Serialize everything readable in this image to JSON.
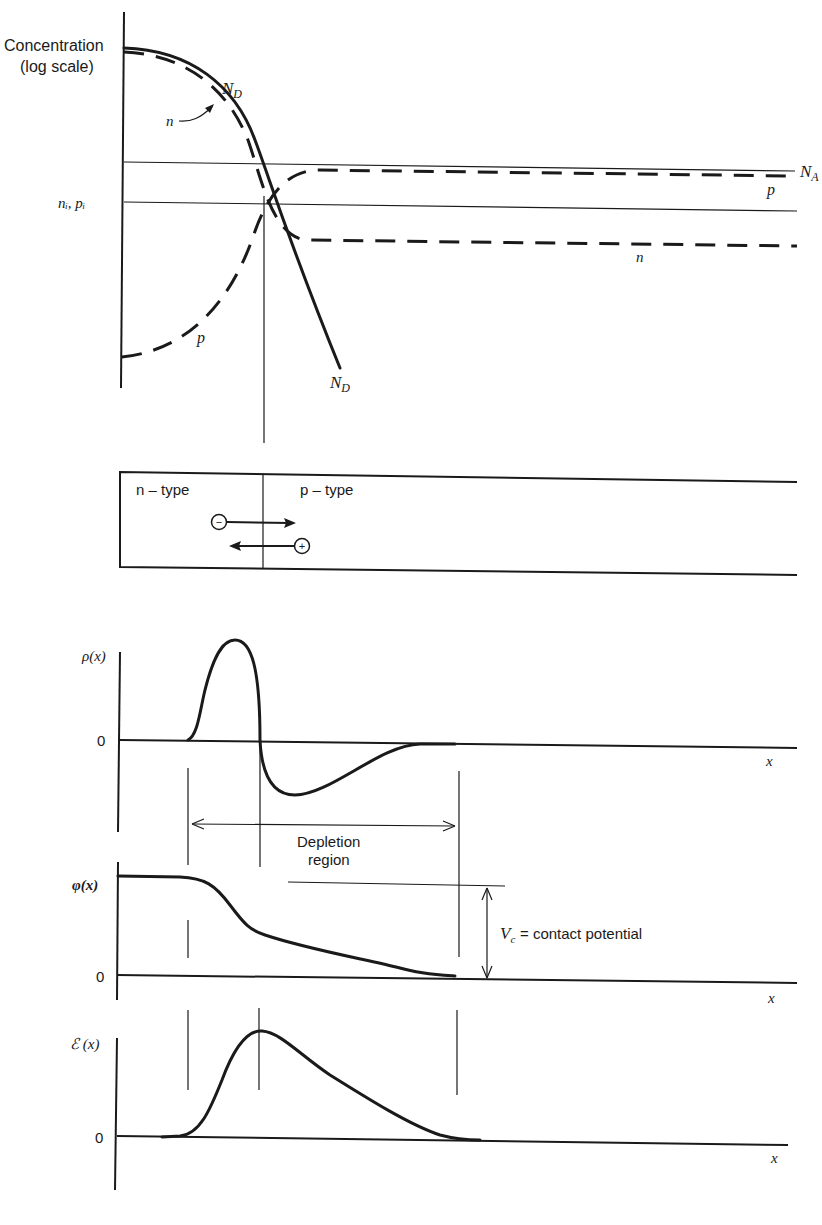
{
  "figure": {
    "concentration_plot": {
      "y_label_line1": "Concentration",
      "y_label_line2": "(log scale)",
      "level_label_ni_pi": "nᵢ, pᵢ",
      "curve_labels": {
        "ND_top": "N",
        "ND_top_sub": "D",
        "n_arrow": "n",
        "NA": "N",
        "NA_sub": "A",
        "p_right": "p",
        "n_right": "n",
        "p_left": "p",
        "ND_bottom": "N",
        "ND_bottom_sub": "D"
      },
      "legend": {
        "solid": "doping profiles (N_D, N_A) and levels",
        "dashed": "carrier concentrations (n, p)"
      }
    },
    "junction_bar": {
      "left_region": "n – type",
      "right_region": "p – type",
      "electron_symbol": "−",
      "hole_symbol": "+"
    },
    "charge_plot": {
      "y_label": "ρ(x)",
      "zero_label": "0",
      "x_label": "x",
      "depletion_label_line1": "Depletion",
      "depletion_label_line2": "region"
    },
    "potential_plot": {
      "y_label": "φ(x)",
      "zero_label": "0",
      "x_label": "x",
      "vc_symbol": "V",
      "vc_sub": "c",
      "vc_text": " = contact potential"
    },
    "field_plot": {
      "y_label": "ℰ (x)",
      "zero_label": "0",
      "x_label": "x"
    }
  },
  "colors": {
    "ink": "#1a1a1a",
    "paper": "#ffffff"
  }
}
